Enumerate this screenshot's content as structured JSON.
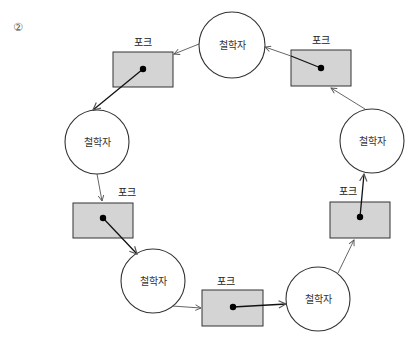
{
  "figure": {
    "number_label": "②",
    "colors": {
      "fork_fill": "#d4d4d4",
      "stroke": "#333333",
      "arrow": "#666666",
      "dot": "#000000"
    },
    "philosopher_label": "철학자",
    "fork_label": "포크",
    "philosophers": [
      {
        "id": "p1",
        "label": "철학자",
        "cx": 232,
        "cy": 45,
        "r": 33
      },
      {
        "id": "p2",
        "label": "철학자",
        "cx": 372,
        "cy": 141,
        "r": 32
      },
      {
        "id": "p3",
        "label": "철학자",
        "cx": 318,
        "cy": 299,
        "r": 32
      },
      {
        "id": "p4",
        "label": "철학자",
        "cx": 153,
        "cy": 281,
        "r": 32
      },
      {
        "id": "p5",
        "label": "철학자",
        "cx": 97,
        "cy": 142,
        "r": 32
      }
    ],
    "forks": [
      {
        "id": "f1",
        "label": "포크",
        "x": 113,
        "y": 52,
        "w": 60,
        "h": 35,
        "dot": [
          143,
          69
        ]
      },
      {
        "id": "f2",
        "label": "포크",
        "x": 291,
        "y": 50,
        "w": 60,
        "h": 36,
        "dot": [
          321,
          68
        ]
      },
      {
        "id": "f3",
        "label": "포크",
        "x": 330,
        "y": 202,
        "w": 60,
        "h": 36,
        "dot": [
          360,
          217
        ]
      },
      {
        "id": "f4",
        "label": "포크",
        "x": 202,
        "y": 290,
        "w": 61,
        "h": 36,
        "dot": [
          233,
          307
        ]
      },
      {
        "id": "f5",
        "label": "포크",
        "x": 73,
        "y": 203,
        "w": 60,
        "h": 35,
        "dot": [
          103,
          218
        ]
      }
    ]
  }
}
